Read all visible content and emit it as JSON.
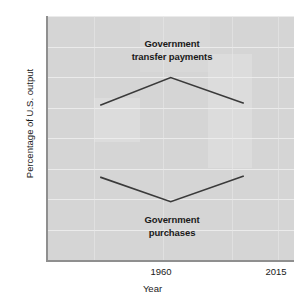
{
  "chart_data": {
    "type": "line",
    "title": "",
    "xlabel": "Year",
    "ylabel": "Percentage of U.S. output",
    "x": [
      1960,
      2015
    ],
    "xlim": [
      1940,
      2035
    ],
    "ylim": [
      0,
      40
    ],
    "ytick_labels": [
      "0",
      "5",
      "10",
      "15",
      "20",
      "25",
      "30",
      "35",
      "40"
    ],
    "ytick_values": [
      0,
      5,
      10,
      15,
      20,
      25,
      30,
      35,
      40
    ],
    "xtick_labels": [
      "1960",
      "2015"
    ],
    "xtick_values": [
      1960,
      2015
    ],
    "grid": true,
    "legend_position": "inline-annotations",
    "series": [
      {
        "name": "Government transfer payments",
        "x": [
          1960,
          1987,
          2015
        ],
        "values": [
          25.5,
          30.0,
          25.8
        ],
        "color": "#3a3a3a"
      },
      {
        "name": "Government purchases",
        "x": [
          1960,
          1987,
          2015
        ],
        "values": [
          13.8,
          9.8,
          14.0
        ],
        "color": "#3a3a3a"
      }
    ],
    "annotations": [
      {
        "id": "transfer",
        "text_line_1": "Government",
        "text_line_2": "transfer payments",
        "points_to": "Government transfer payments"
      },
      {
        "id": "purchases",
        "text_line_1": "Government",
        "text_line_2": "purchases",
        "points_to": "Government purchases"
      }
    ]
  },
  "axes": {
    "y_title": "Percentage of U.S. output",
    "x_title": "Year",
    "y_ticks": [
      {
        "label": "40",
        "value": 40
      },
      {
        "label": "35",
        "value": 35
      },
      {
        "label": "30",
        "value": 30
      },
      {
        "label": "25",
        "value": 25
      },
      {
        "label": "20",
        "value": 20
      },
      {
        "label": "15",
        "value": 15
      },
      {
        "label": "10",
        "value": 10
      },
      {
        "label": "5",
        "value": 5
      },
      {
        "label": "0",
        "value": 0
      }
    ],
    "x_ticks": [
      {
        "label": "1960",
        "value": 1960
      },
      {
        "label": "2015",
        "value": 2015
      }
    ]
  },
  "annotations": {
    "transfer": {
      "line1": "Government",
      "line2": "transfer payments"
    },
    "purchases": {
      "line1": "Government",
      "line2": "purchases"
    }
  },
  "colors": {
    "plot_background": "#d5d5d5",
    "gridline": "#efefef",
    "axis_line": "#8f8f8f",
    "series_line": "#3a3a3a",
    "text": "#1a1a1a",
    "figure_background": "#ffffff"
  }
}
